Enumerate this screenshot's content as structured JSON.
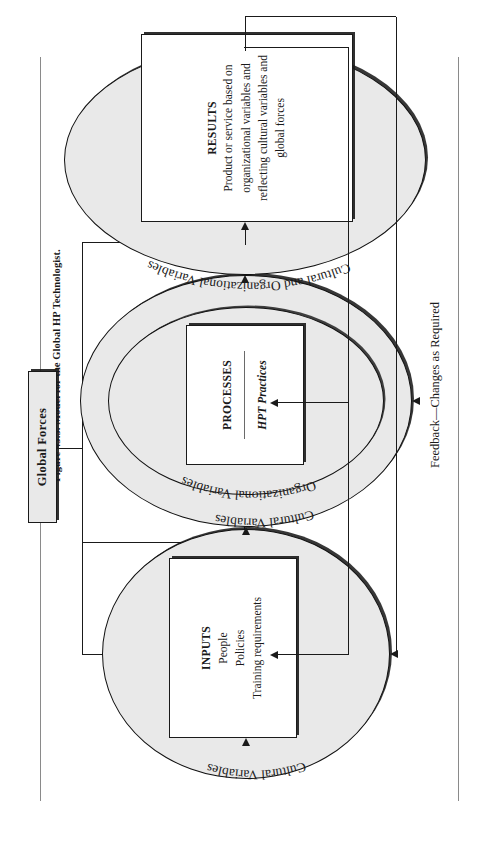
{
  "caption": {
    "text": "Figure 43.3.  Model for the Global HP Technologist."
  },
  "global_forces": {
    "label": "Global Forces"
  },
  "stages": {
    "inputs": {
      "ellipse_label": "Cultural Variables",
      "title": "INPUTS",
      "lines": [
        "People",
        "Policies",
        "Training requirements"
      ]
    },
    "processes": {
      "ellipse_label_outer": "Cultural Variables",
      "ellipse_label_inner": "Organizational Variables",
      "title": "PROCESSES",
      "subtitle": "HPT Practices"
    },
    "results": {
      "ellipse_label": "Cultural and Organizational Variables",
      "title": "RESULTS",
      "body": "Product or service based on organizational variables and reflecting cultural variables and global forces"
    }
  },
  "feedback": {
    "label": "Feedback—Changes as Required"
  },
  "colors": {
    "ellipse_fill": "#e9e9e9",
    "box_fill": "#ffffff",
    "stroke": "#1a1a1a",
    "rule": "#8a8a8a"
  }
}
